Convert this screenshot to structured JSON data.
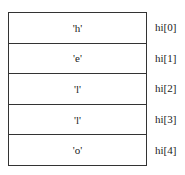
{
  "diagram": {
    "cells": [
      {
        "value": "'h'",
        "label": "hi[0]"
      },
      {
        "value": "'e'",
        "label": "hi[1]"
      },
      {
        "value": "'l'",
        "label": "hi[2]"
      },
      {
        "value": "'l'",
        "label": "hi[3]"
      },
      {
        "value": "'o'",
        "label": "hi[4]"
      }
    ]
  }
}
